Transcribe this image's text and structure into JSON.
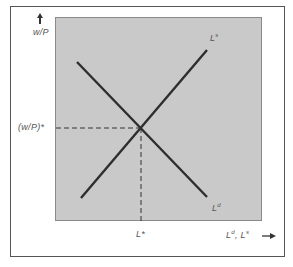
{
  "diagram": {
    "title": "",
    "type": "labor-market-equilibrium",
    "y_axis": {
      "label": "w/P",
      "arrow": "up"
    },
    "x_axis": {
      "label": "L",
      "label_sup_d": "d",
      "label_sep": ", ",
      "label2": "L",
      "label_sup_s": "s",
      "arrow": "→"
    },
    "equilibrium": {
      "wage_label": "(w/P)*",
      "labor_label": "L*"
    },
    "curves": [
      {
        "name": "labor-demand",
        "label": "L",
        "sup": "d",
        "slope": "downward"
      },
      {
        "name": "labor-supply",
        "label": "L",
        "sup": "s",
        "slope": "upward"
      }
    ],
    "colors": {
      "plot_bg": "#c9c9c9",
      "line": "#2e2e2e",
      "text": "#555555",
      "frame": "#555555"
    }
  }
}
